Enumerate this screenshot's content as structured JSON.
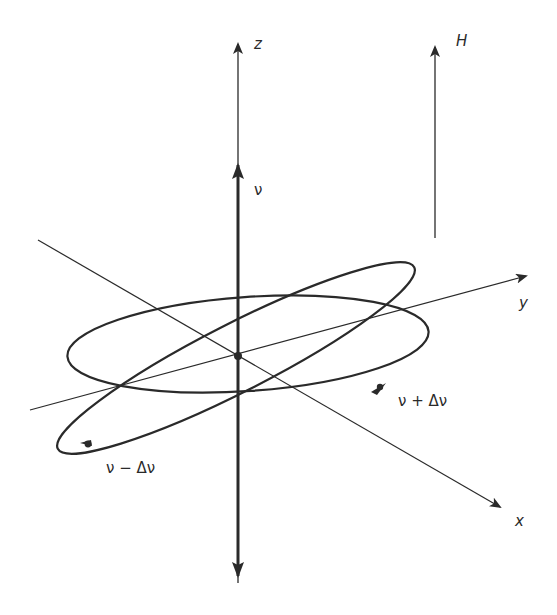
{
  "diagram": {
    "colors": {
      "background": "#ffffff",
      "ink": "#2a2a2a"
    },
    "labels": {
      "z_axis": "z",
      "y_axis": "y",
      "x_axis": "x",
      "field": "H",
      "nu": "ν",
      "nu_plus": "ν + Δν",
      "nu_minus": "ν − Δν"
    },
    "geometry": {
      "origin": [
        238,
        356
      ],
      "z_axis": {
        "top": [
          238,
          42
        ],
        "bottom": [
          238,
          583
        ]
      },
      "nu_vector": {
        "from": [
          238,
          356
        ],
        "to": [
          238,
          163
        ]
      },
      "neg_vector": {
        "from": [
          238,
          356
        ],
        "to": [
          238,
          578
        ]
      },
      "field_arrow": {
        "from": [
          435,
          238
        ],
        "to": [
          435,
          45
        ]
      },
      "y_axis": {
        "from": [
          30,
          410
        ],
        "to": [
          528,
          275
        ]
      },
      "x_axis": {
        "from": [
          38,
          240
        ],
        "to": [
          502,
          508
        ]
      }
    }
  }
}
